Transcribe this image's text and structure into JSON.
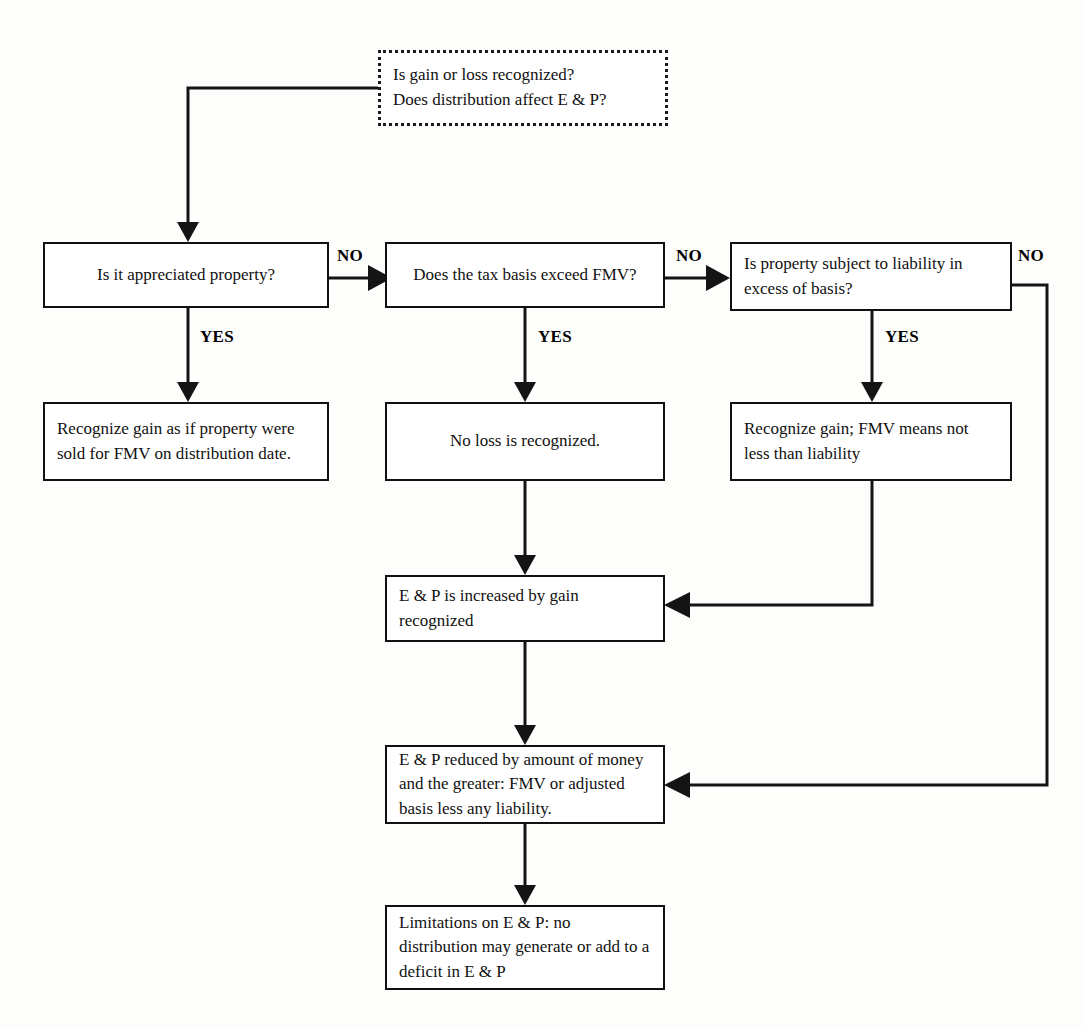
{
  "diagram": {
    "nodes": {
      "start_question": "Is gain or loss recognized?\nDoes distribution affect E & P?",
      "q_appreciated": "Is it appreciated property?",
      "q_basis_exceed_fmv": "Does the tax basis exceed FMV?",
      "q_liability_excess": "Is property subject to liability in excess of basis?",
      "recognize_gain_fmv": "Recognize gain as if property were sold for FMV on distribution date.",
      "no_loss": "No loss is recognized.",
      "recognize_gain_liability": "Recognize gain; FMV means not less than liability",
      "ep_increased": "E & P is increased by gain recognized",
      "ep_reduced": "E & P reduced by amount of money and the greater: FMV or adjusted basis less any liability.",
      "ep_limitations": "Limitations on E & P: no distribution may generate or add to a deficit in E & P"
    },
    "edge_labels": {
      "no_1": "NO",
      "no_2": "NO",
      "no_3": "NO",
      "yes_1": "YES",
      "yes_2": "YES",
      "yes_3": "YES"
    },
    "colors": {
      "stroke": "#141414",
      "box_border": "#111111",
      "background": "#fdfdfc",
      "text": "#111111"
    }
  }
}
